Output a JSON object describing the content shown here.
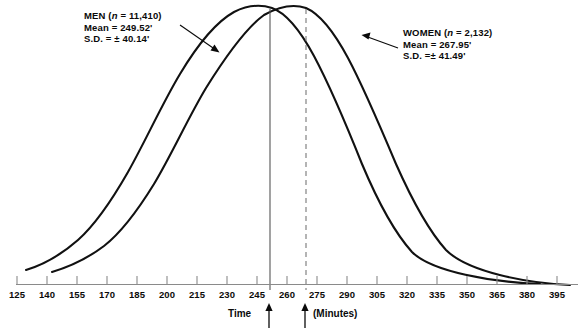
{
  "chart_data": {
    "type": "line",
    "title": "",
    "subtitle": "",
    "xlabel_left": "Time",
    "xlabel_right": "(Minutes)",
    "ylabel": "",
    "grid": false,
    "legend_position": "inline-annotations",
    "xlim": [
      125,
      395
    ],
    "xtick_step": 15,
    "xticks": [
      125,
      140,
      155,
      170,
      185,
      200,
      215,
      230,
      245,
      260,
      275,
      290,
      305,
      320,
      335,
      350,
      365,
      380,
      395
    ],
    "xtick_labels": [
      "125",
      "140",
      "155",
      "170",
      "185",
      "200",
      "215",
      "230",
      "245",
      "260",
      "275",
      "290",
      "305",
      "320",
      "335",
      "350",
      "365",
      "380",
      "395"
    ],
    "series": [
      {
        "name": "MEN",
        "n": "11,410",
        "mean": 249.52,
        "sd": 40.14,
        "mean_label": "249.52'",
        "sd_label": "± 40.14'",
        "marker_line": "solid",
        "distribution": "normal"
      },
      {
        "name": "WOMEN",
        "n": "2,132",
        "mean": 267.95,
        "sd": 41.49,
        "mean_label": "267.95'",
        "sd_label": "± 41.49'",
        "marker_line": "dashed",
        "distribution": "normal"
      }
    ],
    "annotations": [
      {
        "id": "men",
        "lines": [
          "MEN (n = 11,410)",
          "Mean = 249.52'",
          "S.D. = ± 40.14'"
        ],
        "arrow_to_curve": "MEN"
      },
      {
        "id": "women",
        "lines": [
          "WOMEN (n = 2,132)",
          "Mean = 267.95'",
          "S.D. =± 41.49'"
        ],
        "arrow_to_curve": "WOMEN"
      }
    ],
    "mean_markers": [
      {
        "series": "MEN",
        "value": 249.52,
        "style": "solid-vertical-line-with-up-arrow"
      },
      {
        "series": "WOMEN",
        "value": 267.95,
        "style": "dashed-vertical-line-with-up-arrow"
      }
    ]
  },
  "annotations": {
    "men": {
      "name_part": "MEN (",
      "n_italic": "n",
      "n_value": " = 11,410)",
      "mean_line": "Mean = 249.52'",
      "sd_line": "S.D. = ± 40.14'"
    },
    "women": {
      "name_part": "WOMEN (",
      "n_italic": "n",
      "n_value": " = 2,132)",
      "mean_line": "Mean = 267.95'",
      "sd_line": "S.D. =± 41.49'"
    }
  },
  "axis": {
    "title_left": "Time",
    "title_right": "(Minutes)",
    "ticks": [
      "125",
      "140",
      "155",
      "170",
      "185",
      "200",
      "215",
      "230",
      "245",
      "260",
      "275",
      "290",
      "305",
      "320",
      "335",
      "350",
      "365",
      "380",
      "395"
    ]
  },
  "colors": {
    "curve": "#111111",
    "axis": "#8a8a8a",
    "text": "#0a0a0a",
    "mean_line_men": "#555555",
    "mean_line_women": "#777777",
    "background": "#ffffff"
  }
}
